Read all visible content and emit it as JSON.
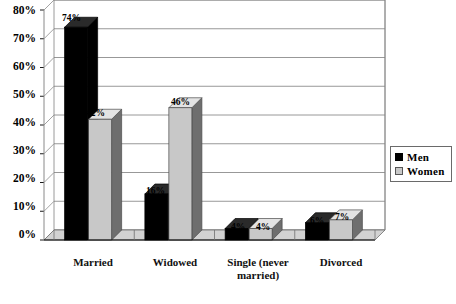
{
  "chart_data": {
    "type": "bar",
    "title": "",
    "subtitle": "",
    "xlabel": "",
    "ylabel": "",
    "categories": [
      "Married",
      "Widowed",
      "Single (never\nmarried)",
      "Divorced"
    ],
    "series": [
      {
        "name": "Men",
        "color": "#000000",
        "values": [
          74,
          16,
          4,
          6
        ],
        "labels": [
          "74%",
          "16%",
          "4%",
          "6%"
        ]
      },
      {
        "name": "Women",
        "color": "#c8c8c8",
        "values": [
          42,
          46,
          4,
          7
        ],
        "labels": [
          "42%",
          "46%",
          "4%",
          "7%"
        ]
      }
    ],
    "ylim": [
      0,
      80
    ],
    "yticks": [
      0,
      10,
      20,
      30,
      40,
      50,
      60,
      70,
      80
    ],
    "ytick_labels": [
      "0%",
      "10%",
      "20%",
      "30%",
      "40%",
      "50%",
      "60%",
      "70%",
      "80%"
    ],
    "grid": true,
    "grid_axis": "y",
    "legend_position": "right",
    "style": "3d-column"
  },
  "axis": {
    "y": {
      "ticks": [
        {
          "label": "80%",
          "value": 80
        },
        {
          "label": "70%",
          "value": 70
        },
        {
          "label": "60%",
          "value": 60
        },
        {
          "label": "50%",
          "value": 50
        },
        {
          "label": "40%",
          "value": 40
        },
        {
          "label": "30%",
          "value": 30
        },
        {
          "label": "20%",
          "value": 20
        },
        {
          "label": "10%",
          "value": 10
        },
        {
          "label": "0%",
          "value": 0
        }
      ]
    },
    "x": {
      "ticks": [
        {
          "label": "Married"
        },
        {
          "label": "Widowed"
        },
        {
          "label": "Single (never\nmarried)"
        },
        {
          "label": "Divorced"
        }
      ]
    }
  },
  "legend": {
    "items": [
      {
        "label": "Men",
        "color": "#000000"
      },
      {
        "label": "Women",
        "color": "#c8c8c8"
      }
    ]
  },
  "value_labels": [
    {
      "text": "74%"
    },
    {
      "text": "42%"
    },
    {
      "text": "16%"
    },
    {
      "text": "46%"
    },
    {
      "text": "4%"
    },
    {
      "text": "4%"
    },
    {
      "text": "6%"
    },
    {
      "text": "7%"
    }
  ]
}
